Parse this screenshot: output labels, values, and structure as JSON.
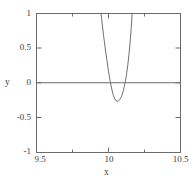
{
  "chart_data": {
    "type": "line",
    "title": "",
    "xlabel": "x",
    "ylabel": "y",
    "xlim": [
      9.5,
      10.5
    ],
    "ylim": [
      -1,
      1
    ],
    "xticks": [
      9.5,
      10.0,
      10.5
    ],
    "xticklabels": [
      "9.5",
      "10",
      "10.5"
    ],
    "xminorticks": [
      9.75,
      10.25
    ],
    "yticks": [
      -1,
      -0.5,
      0,
      0.5,
      1
    ],
    "yticklabels": [
      "-1",
      "-0.5",
      "0",
      "0.5",
      "1"
    ],
    "grid": false,
    "legend": null,
    "zero_line": 0,
    "series": [
      {
        "name": "curve",
        "color": "#6f6f6f",
        "linewidth": 1,
        "comment": "narrow downward spike crossing y=1 near x=9.95 and x=10.16, minimum about y=-0.26 at x=10.07",
        "x": [
          9.948,
          9.952,
          9.958,
          9.966,
          9.976,
          9.988,
          10.0,
          10.012,
          10.024,
          10.034,
          10.044,
          10.052,
          10.06,
          10.068,
          10.074,
          10.08,
          10.086,
          10.092,
          10.098,
          10.104,
          10.11,
          10.118,
          10.126,
          10.134,
          10.142,
          10.15,
          10.158,
          10.164
        ],
        "y": [
          1.0,
          0.93,
          0.82,
          0.68,
          0.52,
          0.34,
          0.17,
          0.02,
          -0.1,
          -0.18,
          -0.23,
          -0.255,
          -0.262,
          -0.258,
          -0.248,
          -0.232,
          -0.21,
          -0.18,
          -0.145,
          -0.102,
          -0.052,
          0.03,
          0.135,
          0.26,
          0.41,
          0.585,
          0.8,
          1.0
        ]
      }
    ]
  },
  "axes": {
    "x_axis_label": "x",
    "y_axis_label": "y",
    "x_tick_labels": [
      "9.5",
      "10",
      "10.5"
    ],
    "y_tick_labels": [
      "1",
      "0.5",
      "0",
      "-0.5",
      "-1"
    ]
  },
  "colors": {
    "frame": "#6b6b6b",
    "curve": "#6f6f6f",
    "zero_line": "#6b6b6b",
    "text": "#3b3b3b",
    "background": "#ffffff"
  }
}
